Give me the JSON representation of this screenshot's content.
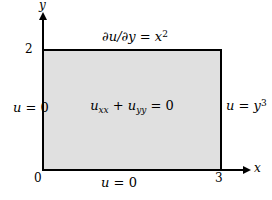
{
  "axes": {
    "x_label": "x",
    "y_label": "y",
    "ticks": {
      "origin": "0",
      "x_max": "3",
      "y_max": "2"
    }
  },
  "interior_equation": {
    "term1_base": "u",
    "term1_sub": "xx",
    "operator": " + ",
    "term2_base": "u",
    "term2_sub": "yy",
    "rhs": " = 0"
  },
  "boundary_conditions": {
    "top": {
      "body": "∂u/∂y = x",
      "exponent": "2"
    },
    "bottom": {
      "variable": "u",
      "rhs": " = 0"
    },
    "left": {
      "variable": "u",
      "rhs": " = 0"
    },
    "right": {
      "body": "u = y",
      "exponent": "3"
    }
  },
  "colors": {
    "background": "#ffffff",
    "region_fill": "#e0e0e0",
    "line": "#000000"
  }
}
